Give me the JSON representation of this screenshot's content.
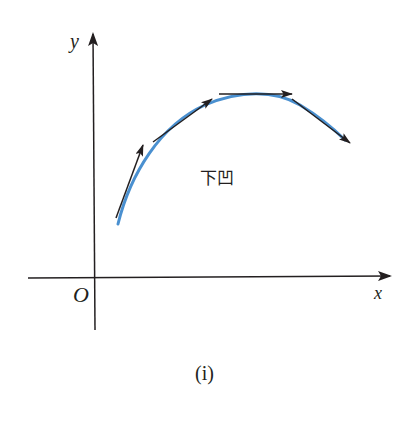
{
  "diagram": {
    "type": "concave-down curve with tangent lines",
    "axes": {
      "x_label": "x",
      "y_label": "y",
      "origin_label": "O"
    },
    "region_label": "下凹",
    "caption": "(i)",
    "colors": {
      "curve": "#4a90d0",
      "axes": "#231f20",
      "tangent": "#231f20",
      "background": "#ffffff"
    },
    "curve": {
      "description": "Concave-down arc rising from lower-left, peaking near top-center, descending to the right",
      "start": [
        118,
        222
      ],
      "peak": [
        255,
        95
      ],
      "end": [
        345,
        140
      ]
    },
    "tangents": [
      {
        "name": "tangent-1",
        "from": [
          116,
          218
        ],
        "to": [
          143,
          145
        ],
        "direction": "up-right steep"
      },
      {
        "name": "tangent-2",
        "from": [
          153,
          142
        ],
        "to": [
          211,
          99
        ],
        "direction": "up-right moderate"
      },
      {
        "name": "tangent-3",
        "from": [
          219,
          94
        ],
        "to": [
          291,
          94
        ],
        "direction": "horizontal right"
      },
      {
        "name": "tangent-4",
        "from": [
          291,
          99
        ],
        "to": [
          350,
          143
        ],
        "direction": "down-right"
      }
    ]
  }
}
